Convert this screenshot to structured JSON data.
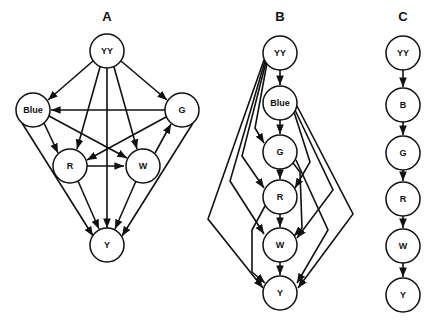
{
  "panels": [
    {
      "id": "A",
      "label": "A",
      "nodes": [
        {
          "id": "YY",
          "label": "YY",
          "x": 107,
          "y": 51
        },
        {
          "id": "Blue",
          "label": "Blue",
          "x": 33,
          "y": 110
        },
        {
          "id": "G",
          "label": "G",
          "x": 182,
          "y": 110
        },
        {
          "id": "R",
          "label": "R",
          "x": 70,
          "y": 166
        },
        {
          "id": "W",
          "label": "W",
          "x": 143,
          "y": 166
        },
        {
          "id": "Y",
          "label": "Y",
          "x": 107,
          "y": 245
        }
      ],
      "edges": [
        [
          "YY",
          "Blue"
        ],
        [
          "YY",
          "G"
        ],
        [
          "YY",
          "R"
        ],
        [
          "YY",
          "W"
        ],
        [
          "YY",
          "Y"
        ],
        [
          "G",
          "Blue"
        ],
        [
          "Blue",
          "R"
        ],
        [
          "Blue",
          "W"
        ],
        [
          "Blue",
          "Y"
        ],
        [
          "G",
          "R"
        ],
        [
          "W",
          "G"
        ],
        [
          "G",
          "Y"
        ],
        [
          "R",
          "W"
        ],
        [
          "R",
          "Y"
        ],
        [
          "W",
          "Y"
        ]
      ]
    },
    {
      "id": "B",
      "label": "B",
      "nodes": [
        {
          "id": "YY",
          "label": "YY",
          "x": 280,
          "y": 53
        },
        {
          "id": "Blue",
          "label": "Blue",
          "x": 280,
          "y": 103
        },
        {
          "id": "G",
          "label": "G",
          "x": 280,
          "y": 152
        },
        {
          "id": "R",
          "label": "R",
          "x": 280,
          "y": 197
        },
        {
          "id": "W",
          "label": "W",
          "x": 280,
          "y": 245
        },
        {
          "id": "Y",
          "label": "Y",
          "x": 280,
          "y": 293
        }
      ],
      "edges": [
        [
          "YY",
          "Blue"
        ],
        [
          "Blue",
          "G"
        ],
        [
          "G",
          "R"
        ],
        [
          "R",
          "W"
        ],
        [
          "W",
          "Y"
        ],
        [
          "YY",
          "G"
        ],
        [
          "YY",
          "R"
        ],
        [
          "YY",
          "W"
        ],
        [
          "YY",
          "Y"
        ],
        [
          "Blue",
          "R"
        ],
        [
          "Blue",
          "W"
        ],
        [
          "Blue",
          "Y"
        ],
        [
          "G",
          "W"
        ],
        [
          "G",
          "Y"
        ],
        [
          "R",
          "Y"
        ]
      ]
    },
    {
      "id": "C",
      "label": "C",
      "nodes": [
        {
          "id": "YY",
          "label": "YY",
          "x": 403,
          "y": 53
        },
        {
          "id": "B",
          "label": "B",
          "x": 403,
          "y": 105
        },
        {
          "id": "G",
          "label": "G",
          "x": 403,
          "y": 153
        },
        {
          "id": "R",
          "label": "R",
          "x": 403,
          "y": 199
        },
        {
          "id": "W",
          "label": "W",
          "x": 403,
          "y": 246
        },
        {
          "id": "Y",
          "label": "Y",
          "x": 403,
          "y": 295
        }
      ],
      "edges": [
        [
          "YY",
          "B"
        ],
        [
          "B",
          "G"
        ],
        [
          "G",
          "R"
        ],
        [
          "R",
          "W"
        ],
        [
          "W",
          "Y"
        ]
      ]
    }
  ],
  "labels": {
    "A": "A",
    "B": "B",
    "C": "C"
  }
}
